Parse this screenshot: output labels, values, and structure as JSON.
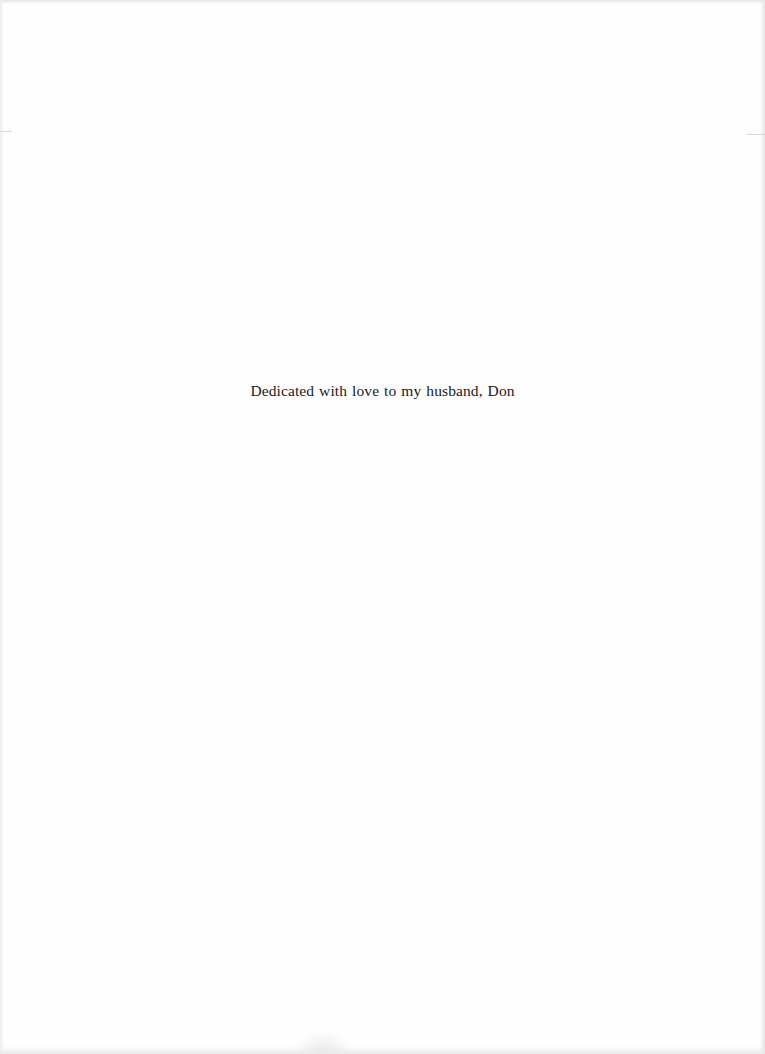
{
  "page": {
    "type": "dedication",
    "dedication_text": "Dedicated with love to my husband, Don"
  }
}
